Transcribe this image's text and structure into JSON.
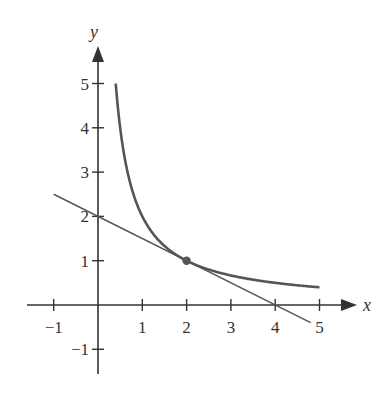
{
  "chart_data": {
    "type": "line",
    "title": "",
    "xlabel": "x",
    "ylabel": "y",
    "xlim": [
      -1.4,
      6.0
    ],
    "ylim": [
      -1.6,
      5.8
    ],
    "grid": false,
    "legend": null,
    "x_ticks": [
      -1,
      1,
      2,
      3,
      4,
      5
    ],
    "x_tick_labels": [
      "−1",
      "1",
      "2",
      "3",
      "4",
      "5"
    ],
    "y_ticks": [
      -1,
      1,
      2,
      3,
      4,
      5
    ],
    "y_tick_labels": [
      "−1",
      "1",
      "2",
      "3",
      "4",
      "5"
    ],
    "series": [
      {
        "name": "curve",
        "description": "y = 2/x",
        "color": "#555555",
        "x": [
          0.4,
          0.5,
          0.6,
          0.8,
          1.0,
          1.25,
          1.5,
          2.0,
          2.5,
          3.0,
          3.5,
          4.0,
          4.5,
          5.0
        ],
        "y": [
          5.0,
          4.0,
          3.333,
          2.5,
          2.0,
          1.6,
          1.333,
          1.0,
          0.8,
          0.667,
          0.571,
          0.5,
          0.444,
          0.4
        ]
      },
      {
        "name": "tangent-line",
        "description": "y = -x/2 + 2",
        "color": "#555555",
        "x": [
          -1.0,
          4.8
        ],
        "y": [
          2.5,
          -0.4
        ]
      }
    ],
    "points": [
      {
        "name": "point-of-tangency",
        "x": 2,
        "y": 1,
        "color": "#555555"
      }
    ]
  },
  "axes": {
    "x_label": "x",
    "y_label": "y",
    "x_tick_labels": [
      "−1",
      "1",
      "2",
      "3",
      "4",
      "5"
    ],
    "y_tick_labels": [
      "−1",
      "1",
      "2",
      "3",
      "4",
      "5"
    ]
  },
  "colors": {
    "axis": "#333333",
    "curve": "#555555",
    "background": "#ffffff"
  }
}
